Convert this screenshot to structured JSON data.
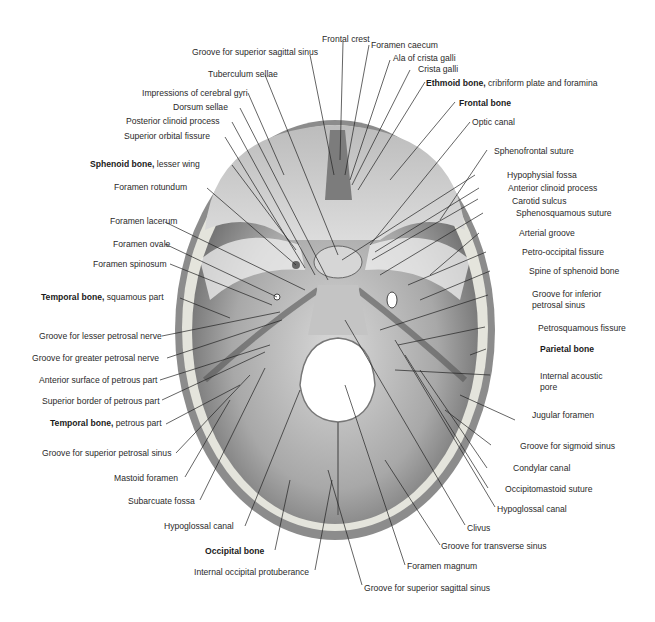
{
  "figure": {
    "colors": {
      "bone_outer": "#cfcfcf",
      "bone_diploe": "#e6e6e0",
      "fossa_fill": "#8a8a8a",
      "leader_line": "#222222",
      "foramen_magnum": "#ffffff"
    }
  },
  "labels": {
    "top": [
      {
        "id": "frontal-crest",
        "text": "Frontal crest"
      },
      {
        "id": "groove-superior-sagittal-sinus-top",
        "text": "Groove for superior sagittal sinus"
      },
      {
        "id": "foramen-caecum",
        "text": "Foramen caecum"
      },
      {
        "id": "ala-crista-galli",
        "text": "Ala of crista galli"
      },
      {
        "id": "crista-galli",
        "text": "Crista galli"
      },
      {
        "id": "tuberculum-sellae",
        "text": "Tuberculum sellae"
      }
    ],
    "left": [
      {
        "id": "impressions-cerebral-gyri",
        "text": "Impressions of cerebral gyri"
      },
      {
        "id": "dorsum-sellae",
        "text": "Dorsum sellae"
      },
      {
        "id": "posterior-clinoid-process",
        "text": "Posterior clinoid process"
      },
      {
        "id": "superior-orbital-fissure",
        "text": "Superior orbital fissure"
      },
      {
        "id": "sphenoid-lesser-wing",
        "bold": "Sphenoid bone,",
        "text": " lesser wing"
      },
      {
        "id": "foramen-rotundum",
        "text": "Foramen rotundum"
      },
      {
        "id": "foramen-lacerum",
        "text": "Foramen lacerum"
      },
      {
        "id": "foramen-ovale",
        "text": "Foramen ovale"
      },
      {
        "id": "foramen-spinosum",
        "text": "Foramen spinosum"
      },
      {
        "id": "temporal-squamous",
        "bold": "Temporal bone,",
        "text": " squamous part"
      },
      {
        "id": "groove-lesser-petrosal",
        "text": "Groove for lesser petrosal nerve"
      },
      {
        "id": "groove-greater-petrosal",
        "text": "Groove for greater petrosal nerve"
      },
      {
        "id": "anterior-surface-petrous",
        "text": "Anterior surface of petrous part"
      },
      {
        "id": "superior-border-petrous",
        "text": "Superior border of petrous part"
      },
      {
        "id": "temporal-petrous",
        "bold": "Temporal bone,",
        "text": " petrous part"
      },
      {
        "id": "groove-superior-petrosal",
        "text": "Groove for superior petrosal sinus"
      },
      {
        "id": "mastoid-foramen",
        "text": "Mastoid foramen"
      },
      {
        "id": "subarcuate-fossa",
        "text": "Subarcuate fossa"
      },
      {
        "id": "hypoglossal-canal-left",
        "text": "Hypoglossal canal"
      }
    ],
    "bottom": [
      {
        "id": "occipital-bone",
        "bold": "Occipital bone",
        "text": ""
      },
      {
        "id": "internal-occipital-protuberance",
        "text": "Internal occipital protuberance"
      },
      {
        "id": "groove-superior-sagittal-sinus-bottom",
        "text": "Groove for superior sagittal sinus"
      },
      {
        "id": "foramen-magnum",
        "text": "Foramen magnum"
      },
      {
        "id": "groove-transverse-sinus",
        "text": "Groove for transverse sinus"
      },
      {
        "id": "clivus",
        "text": "Clivus"
      }
    ],
    "right": [
      {
        "id": "ethmoid-cribriform",
        "bold": "Ethmoid bone,",
        "text": " cribriform plate and foramina"
      },
      {
        "id": "frontal-bone",
        "bold": "Frontal bone",
        "text": ""
      },
      {
        "id": "optic-canal",
        "text": "Optic canal"
      },
      {
        "id": "sphenofrontal-suture",
        "text": "Sphenofrontal suture"
      },
      {
        "id": "hypophysial-fossa",
        "text": "Hypophysial fossa"
      },
      {
        "id": "anterior-clinoid-process",
        "text": "Anterior clinoid process"
      },
      {
        "id": "carotid-sulcus",
        "text": "Carotid sulcus"
      },
      {
        "id": "sphenosquamous-suture",
        "text": "Sphenosquamous suture"
      },
      {
        "id": "arterial-groove",
        "text": "Arterial groove"
      },
      {
        "id": "petro-occipital-fissure",
        "text": "Petro-occipital fissure"
      },
      {
        "id": "spine-sphenoid",
        "text": "Spine of sphenoid bone"
      },
      {
        "id": "groove-inferior-petrosal-1",
        "text": "Groove for inferior"
      },
      {
        "id": "groove-inferior-petrosal-2",
        "text": "petrosal sinus"
      },
      {
        "id": "petrosquamous-fissure",
        "text": "Petrosquamous fissure"
      },
      {
        "id": "parietal-bone",
        "bold": "Parietal bone",
        "text": ""
      },
      {
        "id": "internal-acoustic-pore-1",
        "text": "Internal acoustic"
      },
      {
        "id": "internal-acoustic-pore-2",
        "text": "pore"
      },
      {
        "id": "jugular-foramen",
        "text": "Jugular foramen"
      },
      {
        "id": "groove-sigmoid-sinus",
        "text": "Groove for sigmoid sinus"
      },
      {
        "id": "condylar-canal",
        "text": "Condylar canal"
      },
      {
        "id": "occipitomastoid-suture",
        "text": "Occipitomastoid suture"
      },
      {
        "id": "hypoglossal-canal-right",
        "text": "Hypoglossal canal"
      }
    ]
  }
}
